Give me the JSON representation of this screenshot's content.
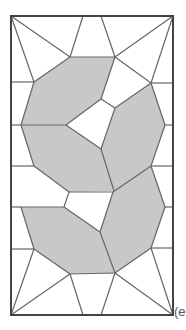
{
  "figure": {
    "label": "(e",
    "colors": {
      "shaded": "#c8c8c8",
      "line": "#666666",
      "frame": "#444444",
      "background": "#ffffff"
    },
    "frame": {
      "x": 11,
      "y": 16,
      "width": 162,
      "height": 299
    },
    "shaded_regions": [
      {
        "name": "upper-left-octagon",
        "points": "70,57 115,57 101,99 66,125 21,125 34,82"
      },
      {
        "name": "upper-right-octagon",
        "points": "151,83 165,125 151,166 114,191 101,149 115,108"
      },
      {
        "name": "middle-left-octagon",
        "points": "21,125 66,125 101,149 114,191 69,192 34,166"
      },
      {
        "name": "lower-left-octagon",
        "points": "21,207 64,207 100,232 115,273 70,274 34,249"
      },
      {
        "name": "lower-right-octagon",
        "points": "114,191 151,166 165,207 151,248 115,273 100,232 113,192"
      }
    ],
    "lines": [
      "11,16 70,57",
      "70,57 83,16",
      "101,16 115,57",
      "115,57 173,16",
      "11,16 34,82",
      "173,16 151,83",
      "11,82 34,82",
      "151,83 173,83",
      "70,57 115,57",
      "34,82 70,57",
      "115,57 151,83",
      "115,57 101,99",
      "101,99 115,108",
      "115,108 151,83",
      "101,99 66,125",
      "34,82 21,125",
      "151,83 165,125",
      "11,125 21,125",
      "21,125 66,125",
      "165,125 173,125",
      "66,125 101,149",
      "101,149 115,108",
      "101,149 114,191",
      "165,125 151,166",
      "21,125 34,166",
      "11,166 34,166",
      "151,166 173,166",
      "34,166 69,192",
      "69,192 113,192",
      "113,192 151,166",
      "69,192 64,207",
      "11,207 21,207",
      "21,207 64,207",
      "151,166 165,207",
      "165,207 173,207",
      "64,207 100,232",
      "100,232 113,192",
      "21,207 34,249",
      "165,207 151,248",
      "100,232 115,273",
      "34,249 70,274",
      "70,274 115,273",
      "115,273 151,248",
      "11,249 34,249",
      "151,248 173,248",
      "34,249 11,315",
      "70,274 11,315",
      "70,274 83,315",
      "115,273 101,315",
      "115,273 173,315",
      "151,248 173,315"
    ]
  }
}
